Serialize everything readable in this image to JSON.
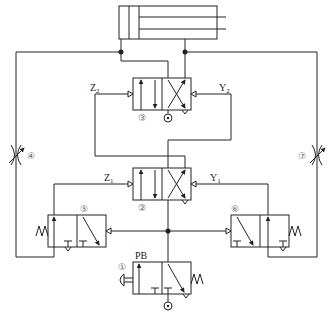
{
  "diagram": {
    "type": "pneumatic-circuit",
    "components": [
      {
        "id": "cylinder",
        "label": "",
        "kind": "double-acting cylinder"
      },
      {
        "id": "1",
        "number": "①",
        "label": "PB",
        "kind": "3/2 push-button valve, spring return"
      },
      {
        "id": "2",
        "number": "②",
        "label": "",
        "kind": "4/2 pilot-operated valve"
      },
      {
        "id": "3",
        "number": "③",
        "label": "",
        "kind": "4/2 pilot-operated valve"
      },
      {
        "id": "4",
        "number": "④",
        "label": "",
        "kind": "adjustable flow control valve"
      },
      {
        "id": "5",
        "number": "⑤",
        "label": "",
        "kind": "3/2 pilot-operated valve, spring return"
      },
      {
        "id": "6",
        "number": "⑥",
        "label": "",
        "kind": "3/2 pilot-operated valve, spring return"
      },
      {
        "id": "7",
        "number": "⑦",
        "label": "",
        "kind": "adjustable flow control valve"
      }
    ],
    "signals": {
      "z1": "Z",
      "z1_sub": "1",
      "y1": "Y",
      "y1_sub": "1",
      "z2": "Z",
      "z2_sub": "2",
      "y2": "Y",
      "y2_sub": "2",
      "pb": "PB"
    },
    "numbers": {
      "n1": "①",
      "n2": "②",
      "n3": "③",
      "n4": "④",
      "n5": "⑤",
      "n6": "⑥",
      "n7": "⑦"
    },
    "colors": {
      "line": "#222222",
      "number": "#666666",
      "background": "#ffffff"
    }
  }
}
